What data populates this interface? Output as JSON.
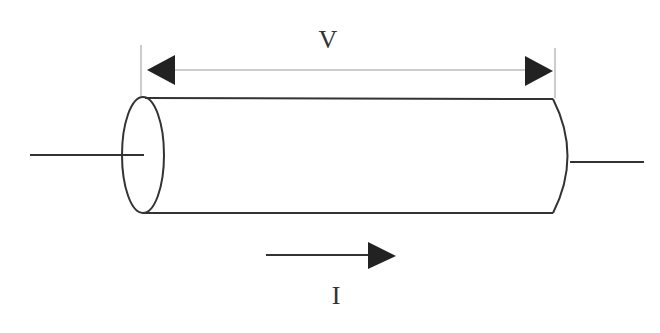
{
  "diagram": {
    "type": "resistor-cylinder",
    "labels": {
      "voltage": "V",
      "current": "I"
    },
    "colors": {
      "stroke": "#333333",
      "dimension_line": "#999999",
      "arrow_fill": "#222222",
      "background": "#ffffff"
    }
  }
}
